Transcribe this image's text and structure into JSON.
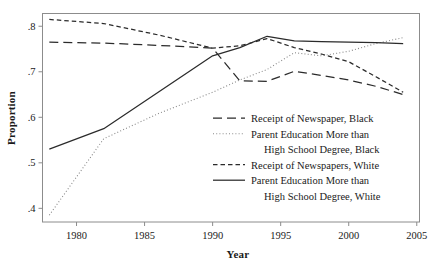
{
  "chart_data": {
    "type": "line",
    "title": "",
    "xlabel": "Year",
    "ylabel": "Proportion",
    "xlim": [
      1977.5,
      2005.2
    ],
    "ylim": [
      0.37,
      0.828
    ],
    "xticks": [
      1980,
      1985,
      1990,
      1995,
      2000,
      2005
    ],
    "xtick_labels": [
      "1980",
      "1985",
      "1990",
      "1995",
      "2000",
      "2005"
    ],
    "yticks": [
      0.4,
      0.5,
      0.6,
      0.7,
      0.8
    ],
    "ytick_labels": [
      ".4",
      ".5",
      ".6",
      ".7",
      ".8"
    ],
    "grid": false,
    "legend_position": "center-right-inside",
    "series": [
      {
        "name": "Receipt of Newspaper, Black",
        "style": "long-dash",
        "color": "#2b2b2b",
        "x": [
          1978,
          1982,
          1986,
          1990,
          1992,
          1994,
          1996,
          1998,
          2000,
          2002,
          2004
        ],
        "values": [
          0.765,
          0.763,
          0.758,
          0.752,
          0.68,
          0.679,
          0.701,
          0.692,
          0.682,
          0.668,
          0.65
        ]
      },
      {
        "name": "Parent Education More than High School Degree, Black",
        "style": "dotted",
        "color": "#8a8a8a",
        "x": [
          1978,
          1982,
          1986,
          1990,
          1992,
          1994,
          1996,
          1998,
          2000,
          2002,
          2004
        ],
        "values": [
          0.385,
          0.553,
          0.608,
          0.655,
          0.682,
          0.705,
          0.742,
          0.735,
          0.745,
          0.762,
          0.775
        ]
      },
      {
        "name": "Receipt of Newspapers, White",
        "style": "short-dash",
        "color": "#2b2b2b",
        "x": [
          1978,
          1982,
          1986,
          1990,
          1992,
          1994,
          1996,
          1998,
          2000,
          2002,
          2004
        ],
        "values": [
          0.815,
          0.806,
          0.781,
          0.752,
          0.757,
          0.773,
          0.753,
          0.739,
          0.722,
          0.689,
          0.655
        ]
      },
      {
        "name": "Parent Education More than High School Degree, White",
        "style": "solid",
        "color": "#2b2b2b",
        "x": [
          1978,
          1982,
          1986,
          1990,
          1992,
          1994,
          1996,
          1998,
          2000,
          2002,
          2004
        ],
        "values": [
          0.53,
          0.575,
          0.655,
          0.735,
          0.753,
          0.778,
          0.768,
          0.766,
          0.765,
          0.764,
          0.762
        ]
      }
    ],
    "legend": [
      {
        "label_line1": "Receipt of Newspaper, Black",
        "label_line2": "",
        "style": "long-dash"
      },
      {
        "label_line1": "Parent Education More than",
        "label_line2": "High School Degree, Black",
        "style": "dotted"
      },
      {
        "label_line1": "Receipt of Newspapers, White",
        "label_line2": "",
        "style": "short-dash"
      },
      {
        "label_line1": "Parent Education More than",
        "label_line2": "High School Degree, White",
        "style": "solid"
      }
    ]
  }
}
